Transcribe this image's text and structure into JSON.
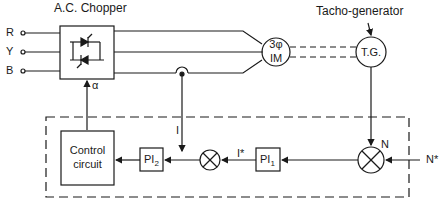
{
  "diagram": {
    "title_chopper": "A.C. Chopper",
    "title_tacho": "Tacho-generator",
    "inputs": [
      "R",
      "Y",
      "B"
    ],
    "alpha": "α",
    "motor": {
      "line1": "3φ",
      "line2": "IM"
    },
    "tg": "T.G.",
    "control_circuit": {
      "line1": "Control",
      "line2": "circuit"
    },
    "pi1": {
      "main": "PI",
      "sub": "1"
    },
    "pi2": {
      "main": "PI",
      "sub": "2"
    },
    "signals": {
      "current_feedback": "I",
      "current_ref": "I*",
      "speed_feedback": "N",
      "speed_ref": "N*"
    },
    "summer_current": {
      "minus": "−",
      "plus": "+"
    },
    "summer_speed": {
      "minus": "−",
      "plus": "+"
    },
    "colors": {
      "line": "#1a1a1a",
      "background": "#ffffff"
    }
  }
}
